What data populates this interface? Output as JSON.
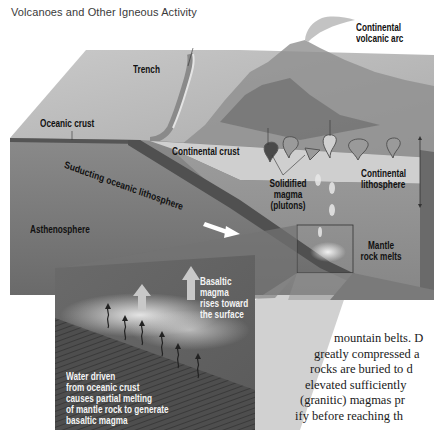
{
  "page": {
    "running_head": "Volcanoes and Other Igneous Activity"
  },
  "figure": {
    "labels": {
      "continental_volcanic_arc": [
        "Continental",
        "volcanic arc"
      ],
      "trench": "Trench",
      "oceanic_crust": "Oceanic crust",
      "continental_crust": "Continental crust",
      "subducting_lithosphere": "Suducting oceanic lithosphere",
      "solidified_magma": [
        "Solidified",
        "magma",
        "(plutons)"
      ],
      "continental_lithosphere": [
        "Continental",
        "lithosphere"
      ],
      "asthenosphere": "Asthenosphere",
      "mantle_rock_melts": [
        "Mantle",
        "rock melts"
      ]
    },
    "inset": {
      "basaltic_magma": [
        "Basaltic",
        "magma",
        "rises toward",
        "the surface"
      ],
      "water_driven": [
        "Water driven",
        "from oceanic crust",
        "causes partial melting",
        "of mantle rock to generate",
        "basaltic magma"
      ]
    }
  },
  "body_text": {
    "lines": [
      "mountain belts. D",
      "greatly compressed a",
      "rocks are buried to d",
      "elevated sufficiently",
      "(granitic) magmas pr",
      "ify before reaching th",
      "tall          a itad with"
    ]
  }
}
